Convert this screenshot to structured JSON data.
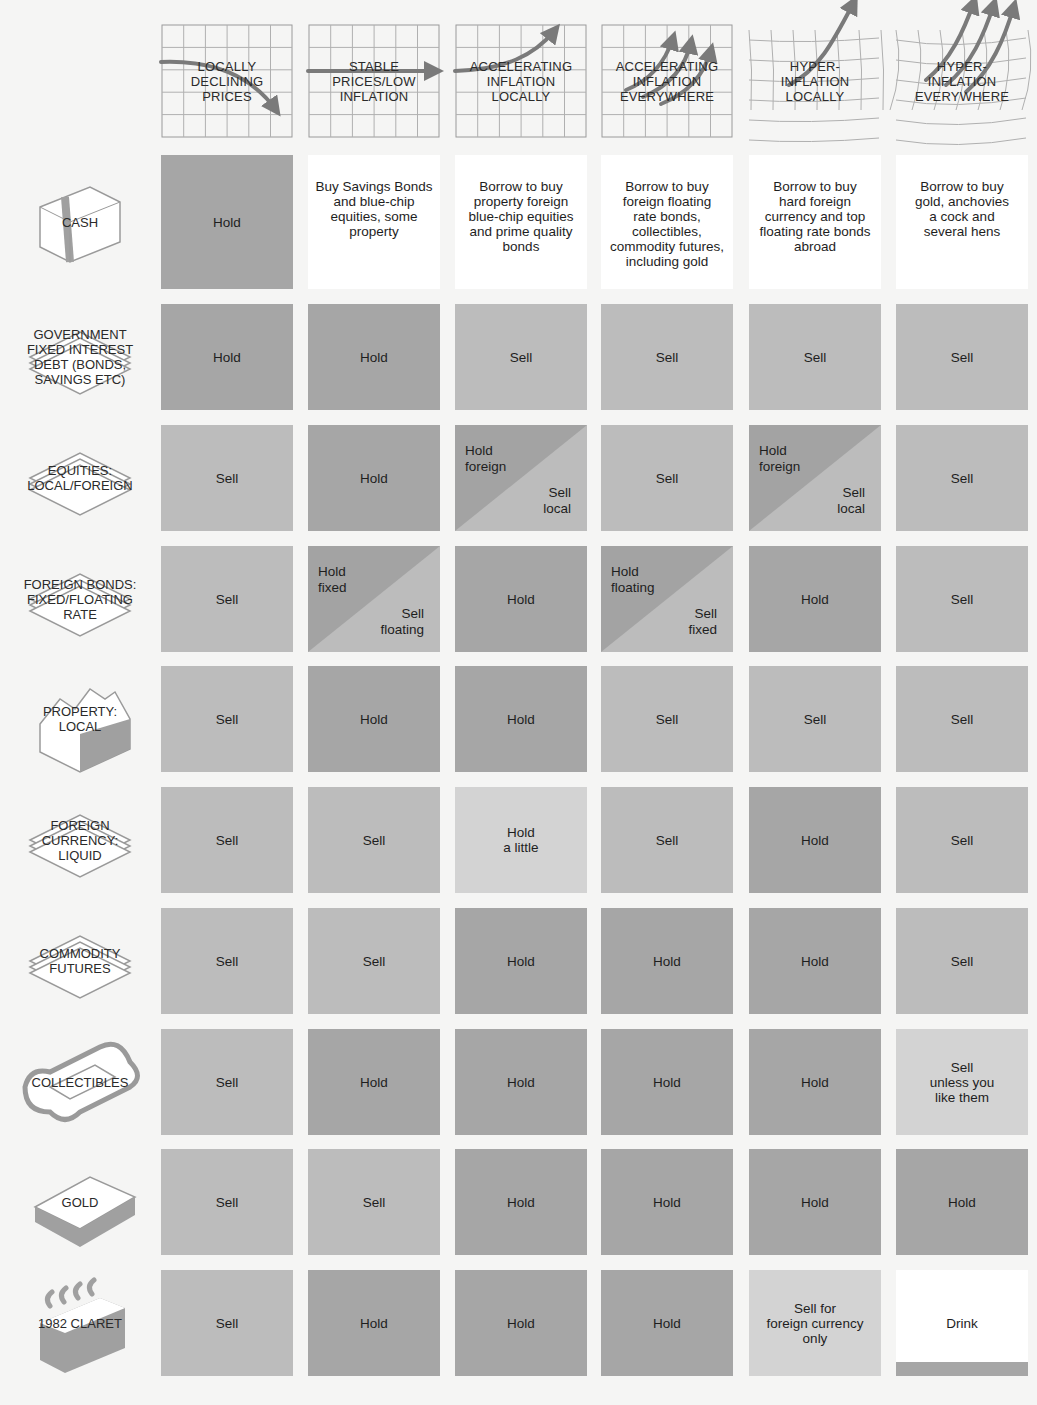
{
  "columns": [
    {
      "label": "LOCALLY\nDECLINING\nPRICES",
      "icon": "falling-arrow-grid-icon"
    },
    {
      "label": "STABLE\nPRICES/LOW\nINFLATION",
      "icon": "flat-arrow-grid-icon"
    },
    {
      "label": "ACCELERATING\nINFLATION\nLOCALLY",
      "icon": "rising-arrow-grid-icon"
    },
    {
      "label": "ACCELERATING\nINFLATION\nEVERYWHERE",
      "icon": "triple-rising-arrow-grid-icon"
    },
    {
      "label": "HYPER-\nINFLATION\nLOCALLY",
      "icon": "distorted-grid-arrow-icon"
    },
    {
      "label": "HYPER-\nINFLATION\nEVERYWHERE",
      "icon": "distorted-grid-triple-arrow-icon"
    }
  ],
  "rows": [
    {
      "label": "CASH",
      "icon": "banknote-stack-icon",
      "cells": [
        {
          "type": "hold",
          "text": "Hold"
        },
        {
          "type": "white",
          "text": "Buy Savings Bonds\nand blue-chip\nequities, some\nproperty"
        },
        {
          "type": "white",
          "text": "Borrow to buy\nproperty foreign\nblue-chip equities\nand prime quality\nbonds"
        },
        {
          "type": "white",
          "text": "Borrow to buy\nforeign floating\nrate bonds,\ncollectibles,\ncommodity futures,\nincluding gold"
        },
        {
          "type": "white",
          "text": "Borrow to buy\nhard foreign\ncurrency and top\nfloating rate bonds\nabroad"
        },
        {
          "type": "white",
          "text": "Borrow to buy\ngold, anchovies\na cock and\nseveral hens"
        }
      ]
    },
    {
      "label": "GOVERNMENT\nFIXED INTEREST\nDEBT (BONDS,\nSAVINGS ETC)",
      "icon": "certificate-stack-icon",
      "cells": [
        {
          "type": "hold",
          "text": "Hold"
        },
        {
          "type": "hold",
          "text": "Hold"
        },
        {
          "type": "sell",
          "text": "Sell"
        },
        {
          "type": "sell",
          "text": "Sell"
        },
        {
          "type": "sell",
          "text": "Sell"
        },
        {
          "type": "sell",
          "text": "Sell"
        }
      ]
    },
    {
      "label": "EQUITIES:\nLOCAL/FOREIGN",
      "icon": "share-certificate-stack-icon",
      "cells": [
        {
          "type": "sell",
          "text": "Sell"
        },
        {
          "type": "hold",
          "text": "Hold"
        },
        {
          "type": "split",
          "top": "Hold\nforeign",
          "bottom": "Sell\nlocal"
        },
        {
          "type": "sell",
          "text": "Sell"
        },
        {
          "type": "split",
          "top": "Hold\nforeign",
          "bottom": "Sell\nlocal"
        },
        {
          "type": "sell",
          "text": "Sell"
        }
      ]
    },
    {
      "label": "FOREIGN BONDS:\nFIXED/FLOATING\nRATE",
      "icon": "bond-certificate-stack-icon",
      "cells": [
        {
          "type": "sell",
          "text": "Sell"
        },
        {
          "type": "split",
          "top": "Hold\nfixed",
          "bottom": "Sell\nfloating"
        },
        {
          "type": "hold",
          "text": "Hold"
        },
        {
          "type": "split",
          "top": "Hold\nfloating",
          "bottom": "Sell\nfixed"
        },
        {
          "type": "hold",
          "text": "Hold"
        },
        {
          "type": "sell",
          "text": "Sell"
        }
      ]
    },
    {
      "label": "PROPERTY:\nLOCAL",
      "icon": "house-row-icon",
      "cells": [
        {
          "type": "sell",
          "text": "Sell"
        },
        {
          "type": "hold",
          "text": "Hold"
        },
        {
          "type": "hold",
          "text": "Hold"
        },
        {
          "type": "sell",
          "text": "Sell"
        },
        {
          "type": "sell",
          "text": "Sell"
        },
        {
          "type": "sell",
          "text": "Sell"
        }
      ]
    },
    {
      "label": "FOREIGN\nCURRENCY:\nLIQUID",
      "icon": "currency-note-stack-icon",
      "cells": [
        {
          "type": "sell",
          "text": "Sell"
        },
        {
          "type": "sell",
          "text": "Sell"
        },
        {
          "type": "light",
          "text": "Hold\na little"
        },
        {
          "type": "sell",
          "text": "Sell"
        },
        {
          "type": "hold",
          "text": "Hold"
        },
        {
          "type": "sell",
          "text": "Sell"
        }
      ]
    },
    {
      "label": "COMMODITY\nFUTURES",
      "icon": "contract-stack-icon",
      "cells": [
        {
          "type": "sell",
          "text": "Sell"
        },
        {
          "type": "sell",
          "text": "Sell"
        },
        {
          "type": "hold",
          "text": "Hold"
        },
        {
          "type": "hold",
          "text": "Hold"
        },
        {
          "type": "hold",
          "text": "Hold"
        },
        {
          "type": "sell",
          "text": "Sell"
        }
      ]
    },
    {
      "label": "COLLECTIBLES",
      "icon": "ornate-frame-icon",
      "cells": [
        {
          "type": "sell",
          "text": "Sell"
        },
        {
          "type": "hold",
          "text": "Hold"
        },
        {
          "type": "hold",
          "text": "Hold"
        },
        {
          "type": "hold",
          "text": "Hold"
        },
        {
          "type": "hold",
          "text": "Hold"
        },
        {
          "type": "light",
          "text": "Sell\nunless you\nlike them"
        }
      ]
    },
    {
      "label": "GOLD",
      "icon": "gold-bar-icon",
      "cells": [
        {
          "type": "sell",
          "text": "Sell"
        },
        {
          "type": "sell",
          "text": "Sell"
        },
        {
          "type": "hold",
          "text": "Hold"
        },
        {
          "type": "hold",
          "text": "Hold"
        },
        {
          "type": "hold",
          "text": "Hold"
        },
        {
          "type": "hold",
          "text": "Hold"
        }
      ]
    },
    {
      "label": "1982 CLARET",
      "icon": "wine-case-icon",
      "cells": [
        {
          "type": "sell",
          "text": "Sell"
        },
        {
          "type": "hold",
          "text": "Hold"
        },
        {
          "type": "hold",
          "text": "Hold"
        },
        {
          "type": "hold",
          "text": "Hold"
        },
        {
          "type": "light",
          "text": "Sell for\nforeign currency\nonly"
        },
        {
          "type": "drink",
          "text": "Drink"
        }
      ]
    }
  ],
  "colors": {
    "hold": "#a6a6a6",
    "sell": "#bcbcbc",
    "light": "#d3d3d3",
    "white": "#ffffff",
    "background": "#f5f5f4"
  }
}
